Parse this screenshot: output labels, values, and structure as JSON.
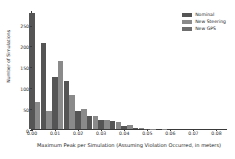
{
  "chart_data": {
    "type": "bar",
    "title": "",
    "xlabel": "Maximum Peak per Simulation (Assuming Violation Occurred, in meters)",
    "ylabel": "Number of Simulations",
    "xlim": [
      0.0,
      0.085
    ],
    "ylim": [
      0,
      285
    ],
    "grid": false,
    "legend_position": "upper right",
    "bar_width": 0.0025,
    "x": [
      0.0025,
      0.0075,
      0.0125,
      0.0175,
      0.0225,
      0.0275,
      0.0325,
      0.0375,
      0.0425,
      0.0475,
      0.0525,
      0.0575,
      0.0625,
      0.0675,
      0.0725,
      0.0775
    ],
    "xticks": [
      0.0,
      0.01,
      0.02,
      0.03,
      0.04,
      0.05,
      0.06,
      0.07,
      0.08
    ],
    "xticklabels": [
      "0.00",
      "0.01",
      "0.02",
      "0.03",
      "0.04",
      "0.05",
      "0.06",
      "0.07",
      "0.08"
    ],
    "yticks": [
      0,
      50,
      100,
      150,
      200,
      250
    ],
    "yticklabels": [
      "0",
      "50",
      "100",
      "150",
      "200",
      "250"
    ],
    "series": [
      {
        "name": "Nominal",
        "color": "#555555",
        "values": [
          278,
          205,
          125,
          115,
          43,
          31,
          21,
          18,
          8,
          3,
          1,
          0,
          0,
          0,
          0,
          0
        ]
      },
      {
        "name": "New Steering",
        "color": "#8a8a8a",
        "values": [
          64,
          42,
          162,
          82,
          48,
          32,
          21,
          17,
          9,
          3,
          1,
          1,
          0,
          0,
          0,
          0
        ]
      },
      {
        "name": "New GPS",
        "color": "#6e6e6e",
        "values": [
          15,
          12,
          20,
          14,
          8,
          5,
          4,
          3,
          2,
          1,
          0,
          0,
          0,
          0,
          0,
          0
        ]
      }
    ]
  }
}
